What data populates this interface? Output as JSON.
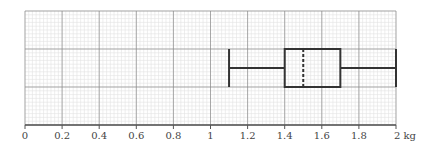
{
  "chart_data": {
    "type": "boxplot",
    "title": "",
    "xlabel": "kg",
    "ylabel": "",
    "xlim": [
      0,
      2
    ],
    "grid": true,
    "x_ticks": [
      0,
      0.2,
      0.4,
      0.6,
      0.8,
      1,
      1.2,
      1.4,
      1.6,
      1.8,
      2
    ],
    "x_tick_labels": [
      "0",
      "0.2",
      "0.4",
      "0.6",
      "0.8",
      "1",
      "1.2",
      "1.4",
      "1.6",
      "1.8",
      "2 kg"
    ],
    "box": {
      "min": 1.1,
      "q1": 1.4,
      "median": 1.5,
      "q3": 1.7,
      "max": 2.0,
      "median_style": "dashed"
    }
  },
  "colors": {
    "major_grid": "#8a8a8a",
    "minor_grid": "#e2e2e2",
    "box_stroke": "#333333",
    "axis": "#555555"
  }
}
